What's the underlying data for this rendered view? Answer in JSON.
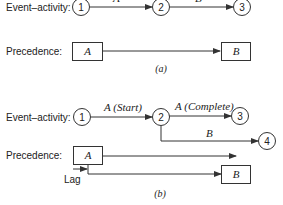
{
  "part_a": {
    "event_activity_label": "Event–activity:",
    "precedence_label": "Precedence:",
    "nodes": [
      "1",
      "2",
      "3"
    ],
    "arrows": [
      {
        "from": "1",
        "to": "2",
        "label": "A"
      },
      {
        "from": "2",
        "to": "3",
        "label": "B"
      }
    ],
    "boxes": [
      "A",
      "B"
    ],
    "caption": "(a)"
  },
  "part_b": {
    "event_activity_label": "Event–activity:",
    "precedence_label": "Precedence:",
    "nodes": [
      "1",
      "2",
      "3",
      "4"
    ],
    "arrows": [
      {
        "from": "1",
        "to": "2",
        "label": "A (Start)"
      },
      {
        "from": "2",
        "to": "3",
        "label": "A (Complete)"
      },
      {
        "from": "2",
        "to": "4",
        "label": "B"
      }
    ],
    "boxes": [
      "A",
      "B"
    ],
    "lag_label": "Lag",
    "caption": "(b)"
  },
  "colors": {
    "line": "#333333",
    "text": "#222222",
    "background": "#ffffff"
  }
}
